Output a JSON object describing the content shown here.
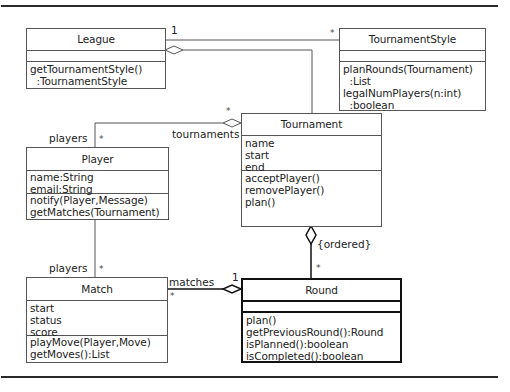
{
  "diagram": {
    "type": "UML class diagram",
    "classes": [
      {
        "id": "league",
        "name": "League",
        "attributes": [],
        "operations": [
          "getTournamentStyle()",
          "  :TournamentStyle"
        ]
      },
      {
        "id": "tournament_style",
        "name": "TournamentStyle",
        "attributes": [],
        "operations": [
          "planRounds(Tournament)",
          "  :List",
          "legalNumPlayers(n:int)",
          "  :boolean"
        ]
      },
      {
        "id": "tournament",
        "name": "Tournament",
        "attributes": [
          "name",
          "start",
          "end"
        ],
        "operations": [
          "acceptPlayer()",
          "removePlayer()",
          "plan()"
        ]
      },
      {
        "id": "player",
        "name": "Player",
        "attributes": [
          "name:String",
          "email:String"
        ],
        "operations": [
          "notify(Player,Message)",
          "getMatches(Tournament)"
        ]
      },
      {
        "id": "match",
        "name": "Match",
        "attributes": [
          "start",
          "status",
          "score"
        ],
        "operations": [
          "playMove(Player,Move)",
          "getMoves():List"
        ]
      },
      {
        "id": "round",
        "name": "Round",
        "attributes": [],
        "operations": [
          "plan()",
          "getPreviousRound():Round",
          "isPlanned():boolean",
          "isCompleted():boolean"
        ]
      }
    ],
    "associations": [
      {
        "from": "League",
        "to": "TournamentStyle",
        "kind": "association",
        "from_mult": "1",
        "to_mult": "*"
      },
      {
        "from": "League",
        "to": "Tournament",
        "kind": "aggregation"
      },
      {
        "from": "Tournament",
        "to": "Player",
        "kind": "aggregation",
        "from_role": "tournaments",
        "from_mult": "*",
        "to_role": "players",
        "to_mult": "*"
      },
      {
        "from": "Player",
        "to": "Match",
        "kind": "association",
        "to_role": "players",
        "to_mult": "*"
      },
      {
        "from": "Tournament",
        "to": "Round",
        "kind": "composition",
        "constraint": "{ordered}",
        "to_mult": "*"
      },
      {
        "from": "Round",
        "to": "Match",
        "kind": "aggregation",
        "from_mult": "1",
        "to_role": "matches",
        "to_mult": "*"
      }
    ]
  },
  "labels": {
    "league_ts_one": "1",
    "league_ts_many": "*",
    "tourn_many": "*",
    "tournaments_role": "tournaments",
    "players_role_top": "players",
    "players_mult_top": "*",
    "players_role_bottom": "players",
    "players_mult_bottom": "*",
    "ordered_constraint": "{ordered}",
    "round_many": "*",
    "matches_role": "matches",
    "matches_many": "*",
    "round_one": "1"
  }
}
